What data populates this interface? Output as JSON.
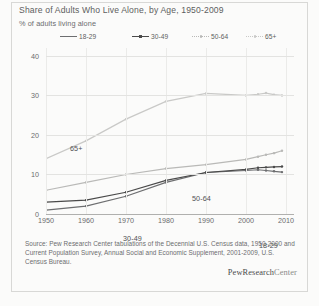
{
  "title": "Share of Adults Who Live Alone, by Age, 1950-2009",
  "subtitle": "% of adults living alone",
  "brand": {
    "pew": "PewResearch",
    "center": "Center"
  },
  "source": "Source: Pew Research Center tabulations of the Decennial U.S. Census data, 1950-2000 and Current Population Survey, Annual Social and Economic Supplement, 2001-2009, U.S. Census Bureau.",
  "legend": [
    {
      "label": "18-29",
      "color": "#6d6e70",
      "style": "solid"
    },
    {
      "label": "30-49",
      "color": "#4a4a4a",
      "style": "solid-marker"
    },
    {
      "label": "50-64",
      "color": "#b9b9b7",
      "style": "dot"
    },
    {
      "label": "65+",
      "color": "#c9c9c7",
      "style": "dot"
    }
  ],
  "inline_labels": [
    {
      "text": "65+",
      "x": 24,
      "y": 96
    },
    {
      "text": "50-64",
      "x": 146,
      "y": 146
    },
    {
      "text": "30-49",
      "x": 77,
      "y": 186
    },
    {
      "text": "18-29",
      "x": 213,
      "y": 193
    }
  ],
  "chart_data": {
    "type": "line",
    "title": "Share of Adults Who Live Alone, by Age, 1950-2009",
    "subtitle": "% of adults living alone",
    "xlabel": "",
    "ylabel": "% of adults living alone",
    "xlim": [
      1950,
      2012
    ],
    "ylim": [
      0,
      42
    ],
    "yticks": [
      0,
      10,
      20,
      30,
      40
    ],
    "xticks": [
      1950,
      1960,
      1970,
      1980,
      1990,
      2000,
      2010
    ],
    "grid": true,
    "legend_position": "top",
    "x": [
      1950,
      1960,
      1970,
      1980,
      1990,
      2000,
      2003,
      2005,
      2007,
      2009
    ],
    "series": [
      {
        "name": "18-29",
        "color": "#6d6e70",
        "values": [
          1.0,
          2.0,
          4.5,
          8.0,
          10.5,
          11.0,
          11.2,
          11.0,
          10.8,
          10.6
        ]
      },
      {
        "name": "30-49",
        "color": "#4a4a4a",
        "values": [
          3.0,
          3.5,
          5.5,
          8.5,
          10.5,
          11.3,
          11.7,
          11.8,
          11.9,
          12.0
        ]
      },
      {
        "name": "50-64",
        "color": "#b9b9b7",
        "values": [
          6.0,
          8.0,
          10.0,
          11.5,
          12.5,
          13.8,
          14.5,
          15.0,
          15.4,
          16.0
        ]
      },
      {
        "name": "65+",
        "color": "#c9c9c7",
        "values": [
          14.0,
          18.5,
          24.0,
          28.5,
          30.5,
          30.0,
          30.3,
          30.6,
          30.2,
          30.0
        ]
      }
    ]
  }
}
